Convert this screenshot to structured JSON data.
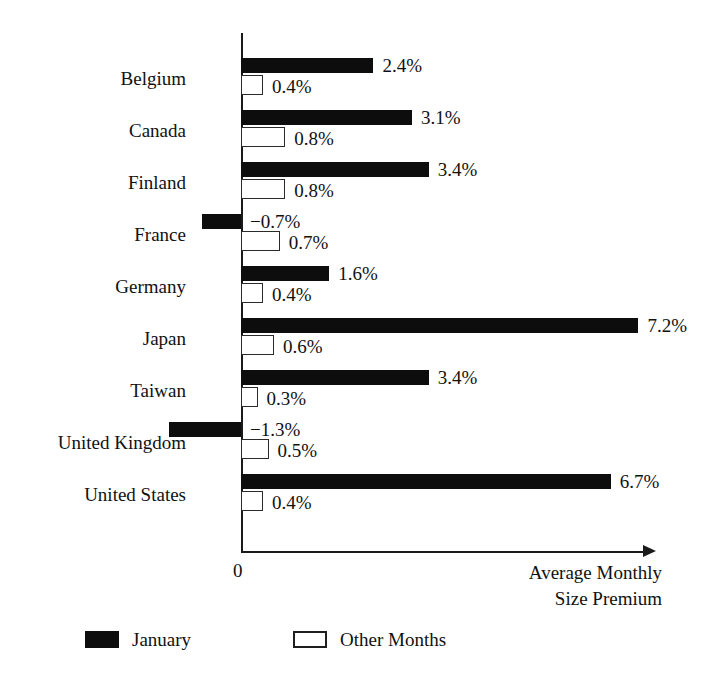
{
  "chart_data": {
    "type": "bar",
    "orientation": "horizontal",
    "title": "",
    "xlabel": "Average Monthly Size Premium",
    "ylabel": "",
    "grid": false,
    "legend_position": "bottom",
    "zero_tick_label": "0",
    "xlim": [
      -1.5,
      7.5
    ],
    "categories": [
      "Belgium",
      "Canada",
      "Finland",
      "France",
      "Germany",
      "Japan",
      "Taiwan",
      "United Kingdom",
      "United States"
    ],
    "series": [
      {
        "name": "January",
        "color": "#0d0d0d",
        "values": [
          2.4,
          3.1,
          3.4,
          -0.7,
          1.6,
          7.2,
          3.4,
          -1.3,
          6.7
        ],
        "labels": [
          "2.4%",
          "3.1%",
          "3.4%",
          "−0.7%",
          "1.6%",
          "7.2%",
          "3.4%",
          "−1.3%",
          "6.7%"
        ]
      },
      {
        "name": "Other Months",
        "color": "#ffffff",
        "values": [
          0.4,
          0.8,
          0.8,
          0.7,
          0.4,
          0.6,
          0.3,
          0.5,
          0.4
        ],
        "labels": [
          "0.4%",
          "0.8%",
          "0.8%",
          "0.7%",
          "0.4%",
          "0.6%",
          "0.3%",
          "0.5%",
          "0.4%"
        ]
      }
    ]
  },
  "axis": {
    "title_line1": "Average Monthly",
    "title_line2": "Size Premium",
    "zero_label": "0"
  },
  "legend": {
    "items": [
      {
        "label": "January",
        "style": "filled"
      },
      {
        "label": "Other Months",
        "style": "hollow"
      }
    ]
  }
}
